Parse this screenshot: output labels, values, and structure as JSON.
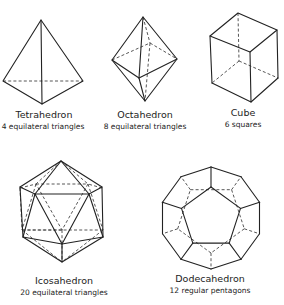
{
  "solids": [
    {
      "id": "tetrahedron",
      "name": "Tetrahedron",
      "description": "4 equilateral triangles"
    },
    {
      "id": "octahedron",
      "name": "Octahedron",
      "description": "8 equilateral triangles"
    },
    {
      "id": "cube",
      "name": "Cube",
      "description": "6 squares"
    },
    {
      "id": "icosahedron",
      "name": "Icosahedron",
      "description": "20 equilateral triangles"
    },
    {
      "id": "dodecahedron",
      "name": "Dodecahedron",
      "description": "12 regular pentagons"
    }
  ]
}
